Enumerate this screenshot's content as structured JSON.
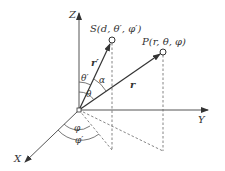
{
  "diagram": {
    "axes": {
      "z_label": "Z",
      "y_label": "Y",
      "x_label": "X"
    },
    "points": {
      "source": {
        "label": "S(d, θ′, φ′)"
      },
      "observer": {
        "label": "P(r, θ, φ)"
      }
    },
    "vectors": {
      "r_prime": "r′",
      "r": "r"
    },
    "angles": {
      "theta_prime": "θ′",
      "theta": "θ",
      "alpha": "α",
      "phi": "φ",
      "phi_prime": "φ′"
    }
  }
}
